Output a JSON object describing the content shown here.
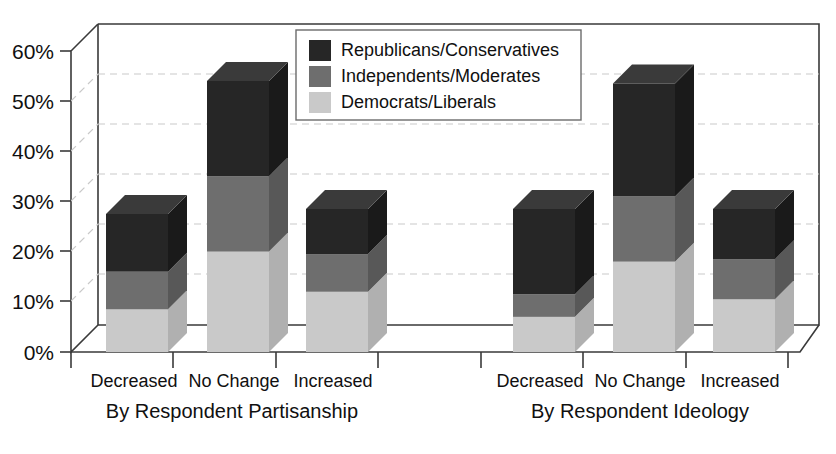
{
  "chart_data": {
    "type": "bar",
    "subtype": "stacked-column-3d",
    "title": "",
    "xlabel": "",
    "ylabel": "",
    "ylim": [
      0,
      60
    ],
    "ytick_labels": [
      "0%",
      "10%",
      "20%",
      "30%",
      "40%",
      "50%",
      "60%"
    ],
    "ytick_values": [
      0,
      10,
      20,
      30,
      40,
      50,
      60
    ],
    "grid": true,
    "grid_axis": "y",
    "legend_position": "top-center-right",
    "categories": [
      "Decreased",
      "No Change",
      "Increased"
    ],
    "groups": [
      {
        "name": "By Respondent Partisanship"
      },
      {
        "name": "By Respondent Ideology"
      }
    ],
    "series": [
      {
        "name": "Republicans/Conservatives",
        "color": "#262626",
        "values_by_group": {
          "By Respondent Partisanship": [
            11.5,
            19.0,
            9.0
          ],
          "By Respondent Ideology": [
            17.0,
            22.5,
            10.0
          ]
        }
      },
      {
        "name": "Independents/Moderates",
        "color": "#6e6e6e",
        "values_by_group": {
          "By Respondent Partisanship": [
            7.5,
            15.0,
            7.5
          ],
          "By Respondent Ideology": [
            4.5,
            13.0,
            8.0
          ]
        }
      },
      {
        "name": "Democrats/Liberals",
        "color": "#c9c9c9",
        "values_by_group": {
          "By Respondent Partisanship": [
            8.5,
            20.0,
            12.0
          ],
          "By Respondent Ideology": [
            7.0,
            18.0,
            10.5
          ]
        }
      }
    ],
    "stack_totals": {
      "By Respondent Partisanship": [
        27.5,
        54.0,
        28.5
      ],
      "By Respondent Ideology": [
        28.5,
        53.5,
        28.5
      ]
    },
    "legend_entries": [
      "Republicans/Conservatives",
      "Independents/Moderates",
      "Democrats/Liberals"
    ],
    "axis_labels_bottom": [
      {
        "group": "By Respondent Partisanship",
        "ticks": [
          "Decreased",
          "No Change",
          "Increased"
        ]
      },
      {
        "group": "By Respondent Ideology",
        "ticks": [
          "Decreased",
          "No Change",
          "Increased"
        ]
      }
    ]
  },
  "colors": {
    "republicans": "#262626",
    "independents": "#6e6e6e",
    "democrats": "#c9c9c9",
    "republicans_top": "#3a3a3a",
    "independents_top": "#858585",
    "democrats_top": "#dcdcdc",
    "republicans_side": "#1a1a1a",
    "independents_side": "#585858",
    "democrats_side": "#b0b0b0",
    "frame": "#3a3a3a",
    "grid": "#c9c9c9",
    "background": "#ffffff",
    "text": "#101010"
  }
}
